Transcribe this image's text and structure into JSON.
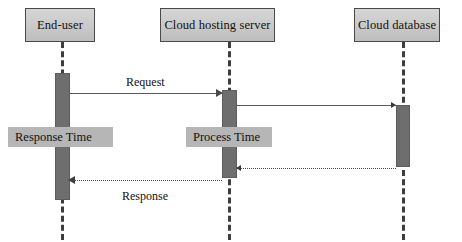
{
  "diagram": {
    "type": "uml-sequence-diagram",
    "background_color": "#ffffff",
    "participant_fill": "#c9c9c9",
    "activation_fill": "#6e6e6e",
    "annotation_fill": "#b6b6b6",
    "line_color": "#4a4a4a"
  },
  "participants": [
    {
      "id": "end-user",
      "label": "End-user"
    },
    {
      "id": "cloud-hosting-server",
      "label": "Cloud hosting server"
    },
    {
      "id": "cloud-database",
      "label": "Cloud database"
    }
  ],
  "messages": [
    {
      "id": "request",
      "label": "Request",
      "from": "end-user",
      "to": "cloud-hosting-server",
      "style": "solid",
      "direction": "right"
    },
    {
      "id": "server-to-database",
      "label": "",
      "from": "cloud-hosting-server",
      "to": "cloud-database",
      "style": "solid",
      "direction": "right"
    },
    {
      "id": "database-to-server",
      "label": "",
      "from": "cloud-database",
      "to": "cloud-hosting-server",
      "style": "dotted",
      "direction": "left"
    },
    {
      "id": "response",
      "label": "Response",
      "from": "cloud-hosting-server",
      "to": "end-user",
      "style": "dotted",
      "direction": "left"
    }
  ],
  "annotations": [
    {
      "id": "response-time",
      "label": "Response Time",
      "measures": "end-user"
    },
    {
      "id": "process-time",
      "label": "Process Time",
      "measures": "cloud-hosting-server"
    }
  ]
}
